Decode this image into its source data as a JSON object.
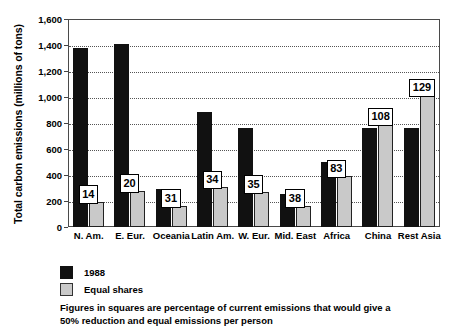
{
  "chart_data": {
    "type": "bar",
    "title": "",
    "xlabel": "",
    "ylabel": "Total carbon emissions (millions of tons)",
    "ylim": [
      0,
      1600
    ],
    "ytick_labels": [
      "0",
      "200",
      "400",
      "600",
      "800",
      "1,000",
      "1,200",
      "1,400",
      "1,600"
    ],
    "ytick_values": [
      0,
      200,
      400,
      600,
      800,
      1000,
      1200,
      1400,
      1600
    ],
    "grid": true,
    "grid_style": "horizontal dotted",
    "legend_position": "below-left",
    "categories": [
      "N. Am.",
      "E. Eur.",
      "Oceania",
      "Latin Am.",
      "W. Eur.",
      "Mid. East",
      "Africa",
      "China",
      "Rest Asia"
    ],
    "series": [
      {
        "name": "1988",
        "color": "#111111",
        "values": [
          1380,
          1410,
          290,
          885,
          765,
          255,
          500,
          760,
          765
        ]
      },
      {
        "name": "Equal shares",
        "color": "#c9c9c9",
        "values": [
          195,
          280,
          165,
          305,
          270,
          165,
          390,
          790,
          1015
        ]
      }
    ],
    "annotations": {
      "label": "percentage of current emissions for 50% reduction and equal emissions per person",
      "values": [
        "14",
        "20",
        "31",
        "34",
        "35",
        "38",
        "83",
        "108",
        "129"
      ]
    },
    "footnote": "Figures in squares are percentage of current emissions that would give a 50% reduction and equal emissions per person"
  },
  "legend": {
    "items": [
      {
        "label": "1988",
        "swatch": "black-square-icon"
      },
      {
        "label": "Equal shares",
        "swatch": "gray-square-icon"
      }
    ]
  }
}
